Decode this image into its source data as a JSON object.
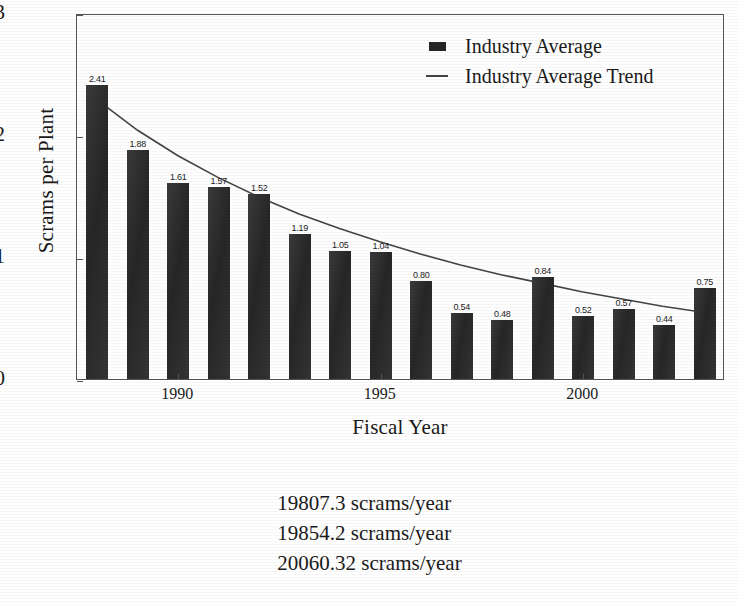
{
  "chart_data": {
    "type": "bar",
    "title": "",
    "xlabel": "Fiscal Year",
    "ylabel": "Scrams per Plant",
    "ylim": [
      0,
      3
    ],
    "yticks": [
      0,
      1,
      2,
      3
    ],
    "xticks": [
      1990,
      1995,
      2000
    ],
    "grid": false,
    "legend_position": "top-right",
    "categories": [
      1988,
      1989,
      1990,
      1991,
      1992,
      1993,
      1994,
      1995,
      1996,
      1997,
      1998,
      1999,
      2000,
      2001,
      2002,
      2003
    ],
    "series": [
      {
        "name": "Industry Average",
        "type": "bar",
        "values": [
          2.41,
          1.88,
          1.61,
          1.57,
          1.52,
          1.19,
          1.05,
          1.04,
          0.8,
          0.54,
          0.48,
          0.84,
          0.52,
          0.57,
          0.44,
          0.75
        ],
        "labels": [
          "2.41",
          "1.88",
          "1.61",
          "1.57",
          "1.52",
          "1.19",
          "1.05",
          "1.04",
          "0.80",
          "0.54",
          "0.48",
          "0.84",
          "0.52",
          "0.57",
          "0.44",
          "0.75"
        ],
        "color": "#2f2f2f"
      },
      {
        "name": "Industry Average Trend",
        "type": "line",
        "values": [
          2.3,
          2.05,
          1.84,
          1.66,
          1.5,
          1.36,
          1.24,
          1.13,
          1.03,
          0.94,
          0.86,
          0.79,
          0.72,
          0.66,
          0.6,
          0.55
        ],
        "color": "#444444"
      }
    ]
  },
  "legend": {
    "items": [
      {
        "label": "Industry Average",
        "key": "bar-swatch"
      },
      {
        "label": "Industry Average Trend",
        "key": "line-swatch"
      }
    ]
  },
  "axes": {
    "y_label": "Scrams per Plant",
    "x_label": "Fiscal Year",
    "y_ticks": [
      "0",
      "1",
      "2",
      "3"
    ],
    "x_ticks": [
      "1990",
      "1995",
      "2000"
    ]
  },
  "summary_table": {
    "rows": [
      {
        "year": "1980",
        "value": "7.3 scrams/year"
      },
      {
        "year": "1985",
        "value": "4.2 scrams/year"
      },
      {
        "year": "2006",
        "value": "0.32 scrams/year"
      }
    ]
  }
}
